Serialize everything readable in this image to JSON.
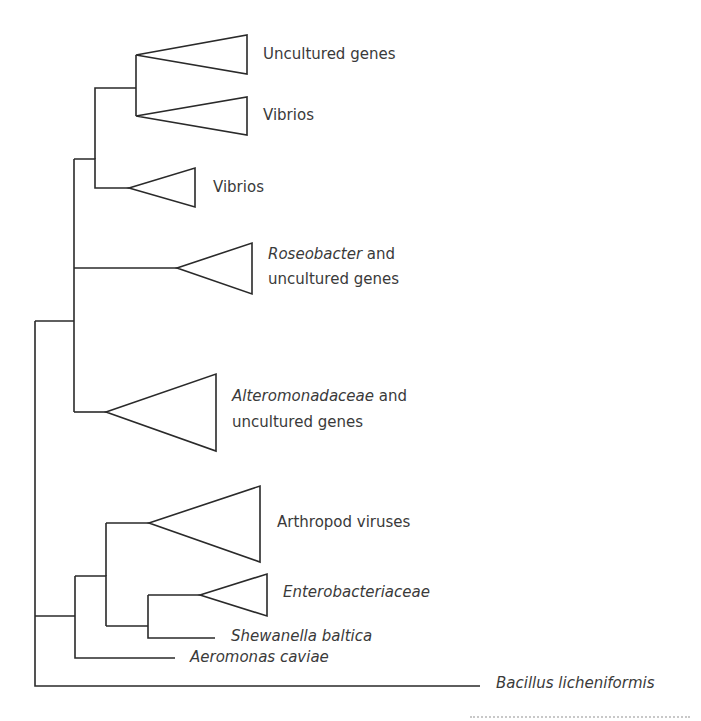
{
  "diagram": {
    "type": "phylogenetic-tree",
    "colors": {
      "line": "#2a2a2a",
      "text": "#3a3a3a"
    },
    "clades": [
      {
        "id": "uncultured-genes",
        "label": "Uncultured genes"
      },
      {
        "id": "vibrios-1",
        "label": "Vibrios"
      },
      {
        "id": "vibrios-2",
        "label": "Vibrios"
      },
      {
        "id": "roseobacter",
        "label_italic": "Roseobacter",
        "label_rest": " and",
        "label_line2": "uncultured genes"
      },
      {
        "id": "alteromonadaceae",
        "label_italic": "Alteromonadaceae",
        "label_rest": " and",
        "label_line2": "uncultured genes"
      },
      {
        "id": "arthropod-viruses",
        "label": "Arthropod viruses"
      },
      {
        "id": "enterobacteriaceae",
        "label_italic": "Enterobacteriaceae"
      }
    ],
    "leaves": [
      {
        "id": "shewanella",
        "label_italic": "Shewanella baltica"
      },
      {
        "id": "aeromonas",
        "label_italic": "Aeromonas caviae"
      },
      {
        "id": "bacillus",
        "label_italic": "Bacillus licheniformis"
      }
    ]
  }
}
